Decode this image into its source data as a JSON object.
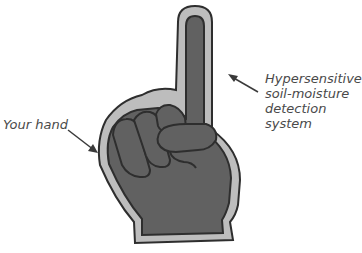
{
  "diagram": {
    "annotations": [
      {
        "id": "sensor",
        "lines": [
          "Hypersensitive",
          "soil-moisture",
          "detection",
          "system"
        ]
      },
      {
        "id": "hand",
        "lines": [
          "Your hand"
        ]
      }
    ],
    "colors": {
      "hand_fill": "#616161",
      "outline_halo": "#bdbdbd",
      "stroke": "#2e2e2e",
      "text": "#4a4a4a",
      "arrow": "#3a3a3a"
    }
  }
}
